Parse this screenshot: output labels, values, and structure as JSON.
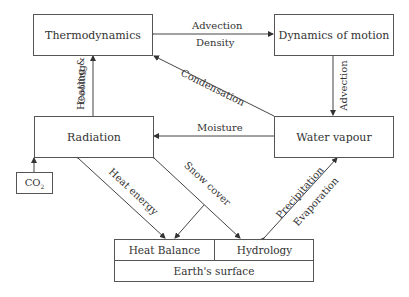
{
  "nodes": {
    "thermodynamics": "Thermodynamics",
    "dynamics": "Dynamics of motion",
    "radiation": "Radiation",
    "water_vapour": "Water vapour",
    "co2": "CO",
    "co2_sub": "2",
    "heat_balance": "Heat Balance",
    "hydrology": "Hydrology",
    "earth_surface": "Earth's surface"
  },
  "edges": {
    "advection_top": "Advection",
    "density": "Density",
    "advection_right": "Advection",
    "condensation": "Condensation",
    "moisture": "Moisture",
    "heating": "Heating &",
    "cooling": "Cooling",
    "heat_energy": "Heat energy",
    "snow_cover": "Snow cover",
    "precipitation": "Precipitation",
    "evaporation": "Evaporation"
  },
  "colors": {
    "line": "#444444",
    "text": "#333333"
  }
}
